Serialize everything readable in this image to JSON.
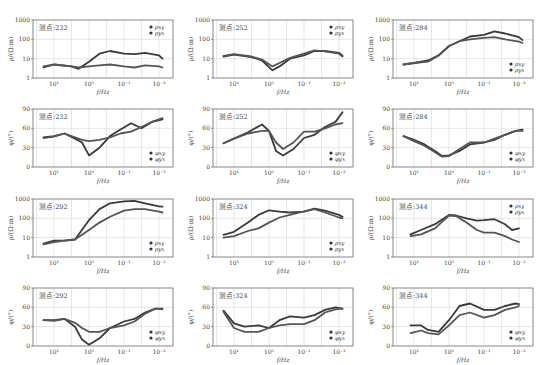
{
  "caption": "",
  "layout": {
    "cols_x": [
      0,
      180,
      360
    ],
    "rows_y": [
      14,
      103,
      193,
      282
    ],
    "plot": {
      "left": 33,
      "top": 6,
      "width": 140,
      "height": 58
    }
  },
  "colors": {
    "series_xy": "#3a3a3a",
    "series_yx": "#555555",
    "grid": "#cfcfcf",
    "axis": "#555555"
  },
  "x_axis": {
    "label": "f/Hz",
    "ticks": [
      "10¹",
      "10⁰",
      "10⁻¹",
      "10⁻²"
    ],
    "log_range": [
      1.6,
      -2.4
    ]
  },
  "chart_data": [
    {
      "type": "line",
      "station": "测点:232",
      "kind": "rho",
      "ylabel": "ρ/(Ω·m)",
      "yticks": [
        "1",
        "10",
        "100",
        "1000"
      ],
      "ylim": [
        1,
        1000
      ],
      "ylog": true,
      "legend": [
        "ρxy",
        "ρyx"
      ],
      "legend_pos": "top-right",
      "x": [
        1.3,
        1.0,
        0.5,
        0.3,
        0.0,
        -0.3,
        -0.6,
        -1.0,
        -1.3,
        -1.6,
        -2.0,
        -2.1
      ],
      "series": [
        {
          "name": "ρxy",
          "values": [
            3.5,
            5,
            4,
            3,
            7,
            18,
            25,
            18,
            17,
            20,
            15,
            10
          ]
        },
        {
          "name": "ρyx",
          "values": [
            4,
            5,
            4,
            3.5,
            4,
            4.5,
            5,
            4,
            3.5,
            4.5,
            4,
            3.5
          ]
        }
      ]
    },
    {
      "type": "line",
      "station": "测点:252",
      "kind": "rho",
      "ylabel": "ρ/(Ω·m)",
      "yticks": [
        "1",
        "10",
        "100",
        "1000"
      ],
      "ylim": [
        1,
        1000
      ],
      "ylog": true,
      "legend": [
        "ρxy",
        "ρyx"
      ],
      "legend_pos": "top-right",
      "x": [
        1.3,
        1.0,
        0.5,
        0.2,
        -0.1,
        -0.3,
        -0.6,
        -1.0,
        -1.3,
        -1.6,
        -2.0,
        -2.1
      ],
      "series": [
        {
          "name": "ρxy",
          "values": [
            13,
            16,
            12,
            8,
            2.5,
            4,
            10,
            15,
            25,
            25,
            20,
            14
          ]
        },
        {
          "name": "ρyx",
          "values": [
            14,
            17,
            13,
            9,
            4,
            6,
            11,
            18,
            27,
            24,
            18,
            13
          ]
        }
      ]
    },
    {
      "type": "line",
      "station": "测点:284",
      "kind": "rho",
      "ylabel": "ρ/(Ω·m)",
      "yticks": [
        "1",
        "10",
        "100",
        "1000"
      ],
      "ylim": [
        1,
        1000
      ],
      "ylog": true,
      "legend": [
        "ρxy",
        "ρyx"
      ],
      "legend_pos": "bottom-right",
      "x": [
        1.3,
        1.0,
        0.6,
        0.3,
        0.0,
        -0.3,
        -0.6,
        -1.0,
        -1.3,
        -1.6,
        -2.0,
        -2.1
      ],
      "series": [
        {
          "name": "ρxy",
          "values": [
            5,
            6,
            8,
            15,
            45,
            80,
            140,
            170,
            260,
            200,
            130,
            90
          ]
        },
        {
          "name": "ρyx",
          "values": [
            5,
            6,
            7,
            14,
            45,
            80,
            100,
            120,
            130,
            100,
            75,
            65
          ]
        }
      ]
    },
    {
      "type": "line",
      "station": "测点:232",
      "kind": "phi",
      "ylabel": "φ/(°)",
      "yticks": [
        "0",
        "30",
        "60",
        "90"
      ],
      "ylim": [
        0,
        90
      ],
      "ylog": false,
      "legend": [
        "φxy",
        "φyx"
      ],
      "legend_pos": "bottom-right",
      "x": [
        1.3,
        1.0,
        0.7,
        0.4,
        0.2,
        0.0,
        -0.3,
        -0.6,
        -0.9,
        -1.2,
        -1.5,
        -1.8,
        -2.1
      ],
      "series": [
        {
          "name": "φxy",
          "values": [
            46,
            48,
            52,
            44,
            38,
            18,
            30,
            48,
            58,
            68,
            60,
            70,
            74
          ]
        },
        {
          "name": "φyx",
          "values": [
            45,
            47,
            52,
            46,
            42,
            40,
            42,
            46,
            52,
            55,
            62,
            70,
            76
          ]
        }
      ]
    },
    {
      "type": "line",
      "station": "测点:252",
      "kind": "phi",
      "ylabel": "φ/(°)",
      "yticks": [
        "0",
        "30",
        "60",
        "90"
      ],
      "ylim": [
        0,
        90
      ],
      "ylog": false,
      "legend": [
        "φxy",
        "φyx"
      ],
      "legend_pos": "bottom-right",
      "x": [
        1.3,
        1.0,
        0.6,
        0.2,
        0.0,
        -0.2,
        -0.4,
        -0.7,
        -1.0,
        -1.3,
        -1.6,
        -1.9,
        -2.1
      ],
      "series": [
        {
          "name": "φxy",
          "values": [
            37,
            44,
            54,
            66,
            56,
            25,
            18,
            28,
            45,
            50,
            62,
            70,
            85
          ]
        },
        {
          "name": "φyx",
          "values": [
            37,
            44,
            52,
            56,
            56,
            38,
            28,
            38,
            55,
            55,
            60,
            66,
            68
          ]
        }
      ]
    },
    {
      "type": "line",
      "station": "测点:284",
      "kind": "phi",
      "ylabel": "φ/(°)",
      "yticks": [
        "0",
        "30",
        "60",
        "90"
      ],
      "ylim": [
        0,
        90
      ],
      "ylog": false,
      "legend": [
        "φxy",
        "φyx"
      ],
      "legend_pos": "bottom-right",
      "x": [
        1.3,
        1.0,
        0.7,
        0.4,
        0.2,
        0.0,
        -0.3,
        -0.6,
        -1.0,
        -1.3,
        -1.6,
        -1.9,
        -2.1
      ],
      "series": [
        {
          "name": "φxy",
          "values": [
            48,
            42,
            35,
            25,
            17,
            18,
            25,
            35,
            38,
            42,
            50,
            56,
            58
          ]
        },
        {
          "name": "φyx",
          "values": [
            48,
            40,
            33,
            23,
            16,
            17,
            28,
            38,
            38,
            44,
            50,
            56,
            56
          ]
        }
      ]
    },
    {
      "type": "line",
      "station": "测点:292",
      "kind": "rho",
      "ylabel": "ρ/(Ω·m)",
      "yticks": [
        "1",
        "10",
        "100",
        "1000"
      ],
      "ylim": [
        1,
        1000
      ],
      "ylog": true,
      "legend": [
        "ρxy",
        "ρyx"
      ],
      "legend_pos": "bottom-right",
      "x": [
        1.3,
        1.0,
        0.7,
        0.4,
        0.0,
        -0.3,
        -0.6,
        -1.0,
        -1.3,
        -1.6,
        -2.0,
        -2.1
      ],
      "series": [
        {
          "name": "ρxy",
          "values": [
            5,
            7,
            7,
            8,
            80,
            300,
            600,
            750,
            800,
            600,
            420,
            400
          ]
        },
        {
          "name": "ρyx",
          "values": [
            4.5,
            6,
            7,
            8,
            25,
            60,
            120,
            250,
            300,
            300,
            220,
            200
          ]
        }
      ]
    },
    {
      "type": "line",
      "station": "测点:324",
      "kind": "rho",
      "ylabel": "ρ/(Ω·m)",
      "yticks": [
        "1",
        "10",
        "100",
        "1000"
      ],
      "ylim": [
        1,
        1000
      ],
      "ylog": true,
      "legend": [
        "ρxy",
        "ρyx"
      ],
      "legend_pos": "bottom-right",
      "x": [
        1.3,
        1.0,
        0.6,
        0.3,
        0.0,
        -0.3,
        -0.6,
        -1.0,
        -1.3,
        -1.6,
        -2.0,
        -2.1
      ],
      "series": [
        {
          "name": "ρxy",
          "values": [
            14,
            20,
            60,
            150,
            260,
            220,
            200,
            220,
            320,
            250,
            150,
            120
          ]
        },
        {
          "name": "ρyx",
          "values": [
            10,
            12,
            22,
            30,
            60,
            110,
            150,
            230,
            300,
            200,
            110,
            100
          ]
        }
      ]
    },
    {
      "type": "line",
      "station": "测点:344",
      "kind": "rho",
      "ylabel": "ρ/(Ω·m)",
      "yticks": [
        "1",
        "10",
        "100",
        "1000"
      ],
      "ylim": [
        1,
        1000
      ],
      "ylog": true,
      "legend": [
        "ρxy",
        "ρyx"
      ],
      "legend_pos": "top-right",
      "x": [
        1.1,
        0.8,
        0.4,
        0.0,
        -0.2,
        -0.5,
        -0.8,
        -1.0,
        -1.3,
        -1.6,
        -1.8,
        -2.0
      ],
      "series": [
        {
          "name": "ρxy",
          "values": [
            15,
            25,
            50,
            150,
            140,
            100,
            75,
            80,
            90,
            50,
            25,
            30
          ]
        },
        {
          "name": "ρyx",
          "values": [
            12,
            15,
            30,
            140,
            130,
            60,
            25,
            18,
            18,
            12,
            8,
            6
          ]
        }
      ]
    },
    {
      "type": "line",
      "station": "测点:292",
      "kind": "phi",
      "ylabel": "φ/(°)",
      "yticks": [
        "0",
        "30",
        "60",
        "90"
      ],
      "ylim": [
        0,
        90
      ],
      "ylog": false,
      "legend": [
        "φxy",
        "φyx"
      ],
      "legend_pos": "bottom-right",
      "x": [
        1.3,
        1.0,
        0.7,
        0.4,
        0.2,
        0.0,
        -0.3,
        -0.6,
        -1.0,
        -1.3,
        -1.6,
        -1.9,
        -2.1
      ],
      "series": [
        {
          "name": "φxy",
          "values": [
            40,
            40,
            42,
            30,
            10,
            2,
            12,
            28,
            38,
            42,
            52,
            58,
            58
          ]
        },
        {
          "name": "φyx",
          "values": [
            40,
            39,
            42,
            36,
            28,
            22,
            22,
            28,
            32,
            38,
            50,
            58,
            57
          ]
        }
      ]
    },
    {
      "type": "line",
      "station": "测点:324",
      "kind": "phi",
      "ylabel": "φ/(°)",
      "yticks": [
        "0",
        "30",
        "60",
        "90"
      ],
      "ylim": [
        0,
        90
      ],
      "ylog": false,
      "legend": [
        "φxy",
        "φyx"
      ],
      "legend_pos": "bottom-right",
      "x": [
        1.3,
        1.0,
        0.7,
        0.3,
        0.0,
        -0.3,
        -0.6,
        -1.0,
        -1.3,
        -1.6,
        -1.9,
        -2.1
      ],
      "series": [
        {
          "name": "φxy",
          "values": [
            55,
            35,
            30,
            32,
            28,
            40,
            46,
            44,
            48,
            56,
            60,
            58
          ]
        },
        {
          "name": "φyx",
          "values": [
            53,
            28,
            22,
            22,
            28,
            32,
            34,
            34,
            40,
            52,
            57,
            58
          ]
        }
      ]
    },
    {
      "type": "line",
      "station": "测点:344",
      "kind": "phi",
      "ylabel": "φ/(°)",
      "yticks": [
        "0",
        "30",
        "60",
        "90"
      ],
      "ylim": [
        0,
        90
      ],
      "ylog": false,
      "legend": [
        "φxy",
        "φyx"
      ],
      "legend_pos": "bottom-right",
      "x": [
        1.1,
        0.8,
        0.6,
        0.3,
        0.0,
        -0.3,
        -0.6,
        -1.0,
        -1.3,
        -1.6,
        -1.9,
        -2.0
      ],
      "series": [
        {
          "name": "φxy",
          "values": [
            32,
            32,
            25,
            22,
            40,
            62,
            66,
            56,
            56,
            62,
            66,
            65
          ]
        },
        {
          "name": "φyx",
          "values": [
            20,
            24,
            20,
            18,
            32,
            48,
            52,
            44,
            48,
            56,
            60,
            62
          ]
        }
      ]
    }
  ]
}
